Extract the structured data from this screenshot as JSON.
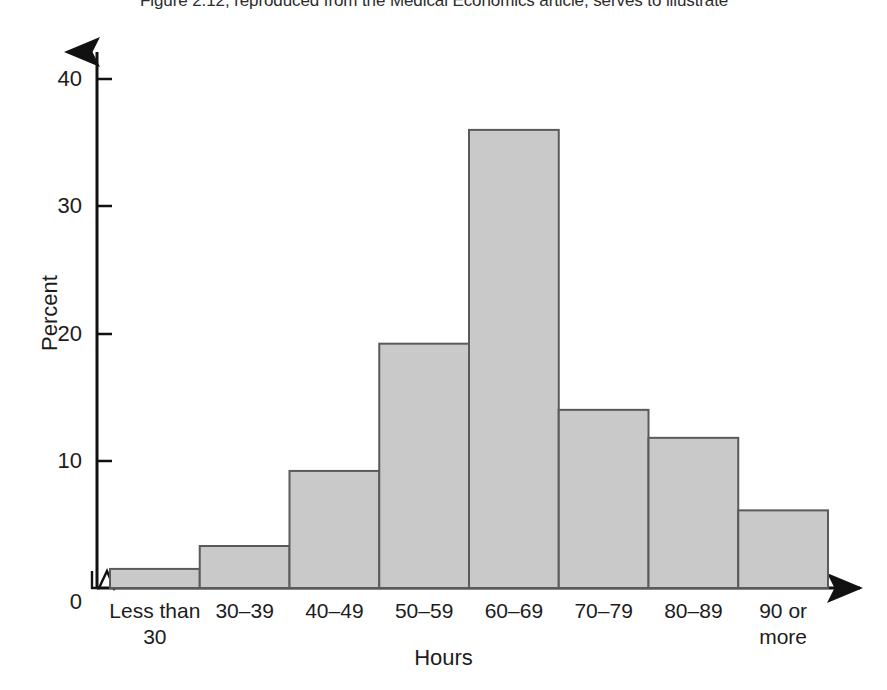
{
  "caption": {
    "text": "Figure 2.12, reproduced from the Medical Economics article, serves to illustrate"
  },
  "colors": {
    "bar_fill": "#c9c9c9",
    "bar_stroke": "#5a5a5a",
    "axis": "#111111",
    "text": "#1c1c1c",
    "background": "#ffffff"
  },
  "chart_data": {
    "type": "bar",
    "title": "",
    "subtitle": "",
    "xlabel": "Hours",
    "ylabel": "Percent",
    "categories": [
      "Less than\n30",
      "30–39",
      "40–49",
      "50–59",
      "60–69",
      "70–79",
      "80–89",
      "90 or\nmore"
    ],
    "values": [
      1.5,
      3.3,
      9.2,
      19.2,
      36.0,
      14.0,
      11.8,
      6.1
    ],
    "ylim": [
      0,
      42
    ],
    "yticks": [
      0,
      10,
      20,
      30,
      40
    ],
    "ytick_labels": [
      "0",
      "10",
      "20",
      "30",
      "40"
    ],
    "grid": false,
    "legend": null,
    "axis_break": {
      "axis": "x",
      "symbol": "zigzag",
      "note": "break between origin and first bar"
    },
    "axis_arrows": {
      "x": true,
      "y": true
    },
    "bar_gap": 0
  }
}
